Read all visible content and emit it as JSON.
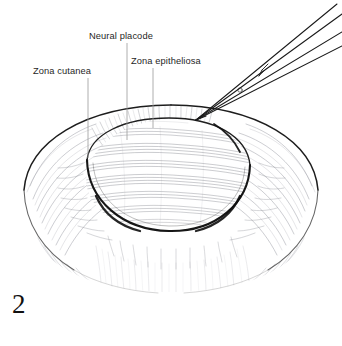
{
  "figure": {
    "number": "2",
    "style": "pen-and-ink-line-drawing",
    "background_color": "#ffffff",
    "ink_color": "#1a1a1a",
    "hatch_color": "#8d8d95",
    "leader_color": "#9a9a9a"
  },
  "labels": {
    "zona_cutanea": "Zona cutanea",
    "neural_placode": "Neural placode",
    "zona_epitheliosa": "Zona epitheliosa"
  },
  "leaders": [
    {
      "name": "leader-zona-cutanea",
      "x1": 88,
      "y1": 78,
      "x2": 88,
      "y2": 158
    },
    {
      "name": "leader-neural-placode",
      "x1": 127,
      "y1": 43,
      "x2": 127,
      "y2": 140
    },
    {
      "name": "leader-zona-epitheliosa",
      "x1": 153,
      "y1": 68,
      "x2": 153,
      "y2": 128
    }
  ],
  "instrument": {
    "name": "forceps",
    "arm_count": 2,
    "tip_x": 196,
    "tip_y": 120
  },
  "anatomy": {
    "outer_sac": {
      "cx": 171,
      "cy": 190,
      "rx": 150,
      "ry": 95
    },
    "placode": {
      "cx": 168,
      "cy": 175,
      "rx": 82,
      "ry": 56,
      "rotation_deg": -6
    },
    "placode_band_count": 9
  }
}
